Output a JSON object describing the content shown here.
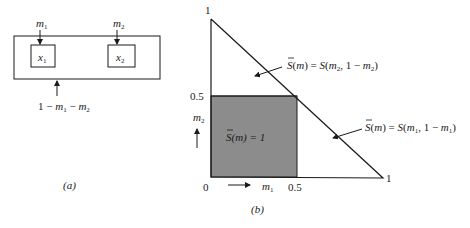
{
  "panel_a": {
    "caption": "(a)",
    "outer_box": "system",
    "inner_boxes": [
      {
        "label": "x",
        "sub": "1",
        "input_label": "m",
        "input_sub": "1"
      },
      {
        "label": "x",
        "sub": "2",
        "input_label": "m",
        "input_sub": "2"
      }
    ],
    "bottom_input": {
      "text_1": "1 − ",
      "m1": "m",
      "m1_sub": "1",
      "minus": " − ",
      "m2": "m",
      "m2_sub": "2"
    }
  },
  "panel_b": {
    "caption": "(b)",
    "axis": {
      "origin": "0",
      "x_half": "0.5",
      "x_one": "1",
      "y_half": "0.5",
      "y_one": "1",
      "x_label": "m",
      "x_label_sub": "1",
      "y_label": "m",
      "y_label_sub": "2"
    },
    "region_square": {
      "text": "S(m) = 1",
      "fill": "#8c8c8c"
    },
    "annotation_upper": {
      "lhs": "S(m) = S(m",
      "sub1": "2",
      "mid": ", 1 − m",
      "sub2": "2",
      "end": ")"
    },
    "annotation_lower": {
      "lhs": "S(m) = S(m",
      "sub1": "1",
      "mid": ", 1 − m",
      "sub2": "1",
      "end": ")"
    }
  },
  "colors": {
    "line": "#1a1a1a",
    "shade": "#8c8c8c",
    "background": "#ffffff"
  }
}
